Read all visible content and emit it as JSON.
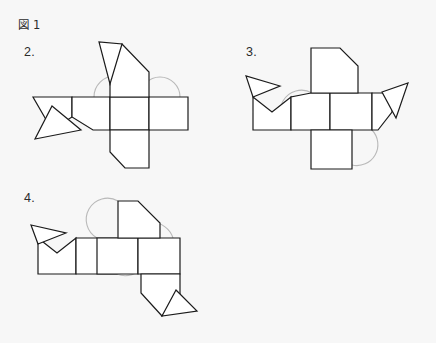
{
  "page": {
    "background_color": "#f7f7f7",
    "stroke_color": "#1b1b1b",
    "arc_color": "#b9b9b9",
    "fill_color": "#ffffff",
    "text_color": "#2b2b2b"
  },
  "caption": {
    "prefix": "図",
    "number": "1",
    "full": "図 1"
  },
  "figures": [
    {
      "id": "figure-2",
      "label": "2.",
      "description": "polyhedron net with central band of four squares, upward pentagon with folded triangular flap, left square with triangular flap, lower-left notched pentagon",
      "arcs": 2
    },
    {
      "id": "figure-3",
      "label": "3.",
      "description": "polyhedron net with horizontal band, upward clipped pentagon, left peaked squares with triangular flap, right triangular flap, lower square",
      "arcs": 2
    },
    {
      "id": "figure-4",
      "label": "4.",
      "description": "polyhedron net with horizontal band of squares, upward clipped pentagon, left peaked square with triangular flap, lower-right notched pentagon with triangular flap",
      "arcs": 3
    }
  ]
}
